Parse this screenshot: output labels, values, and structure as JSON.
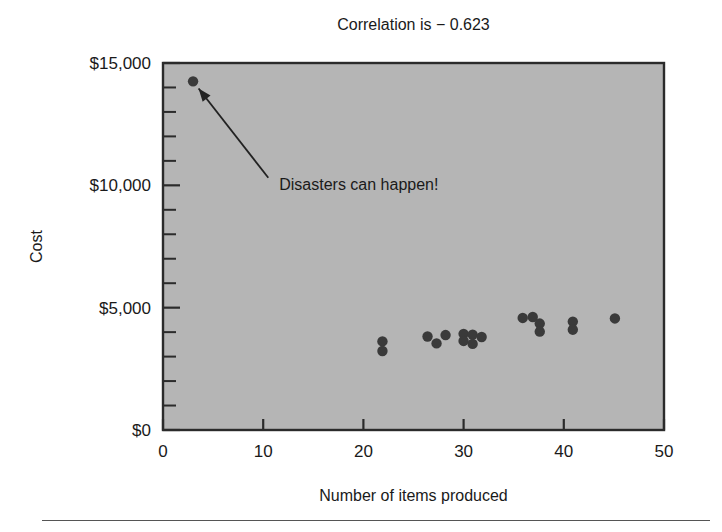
{
  "chart_data": {
    "type": "scatter",
    "title": "Correlation is − 0.623",
    "xlabel": "Number of items produced",
    "ylabel": "Cost",
    "xlim": [
      0,
      50
    ],
    "ylim": [
      0,
      15000
    ],
    "grid": false,
    "legend": null,
    "x_ticks": [
      0,
      10,
      20,
      30,
      40,
      50
    ],
    "x_tick_labels": [
      "0",
      "10",
      "20",
      "30",
      "40",
      "50"
    ],
    "y_ticks": [
      0,
      5000,
      10000,
      15000
    ],
    "y_tick_labels": [
      "$0",
      "$5,000",
      "$10,000",
      "$15,000"
    ],
    "y_minor_tick_step": 1000,
    "plot_background_color": "#b5b5b5",
    "point_color": "#3a3a3a",
    "points": [
      {
        "x": 3.0,
        "y": 14250
      },
      {
        "x": 21.9,
        "y": 3620
      },
      {
        "x": 21.9,
        "y": 3230
      },
      {
        "x": 26.4,
        "y": 3820
      },
      {
        "x": 27.3,
        "y": 3540
      },
      {
        "x": 28.2,
        "y": 3880
      },
      {
        "x": 30.0,
        "y": 3930
      },
      {
        "x": 30.0,
        "y": 3640
      },
      {
        "x": 30.9,
        "y": 3900
      },
      {
        "x": 30.9,
        "y": 3520
      },
      {
        "x": 31.8,
        "y": 3800
      },
      {
        "x": 35.9,
        "y": 4580
      },
      {
        "x": 36.9,
        "y": 4620
      },
      {
        "x": 37.6,
        "y": 4350
      },
      {
        "x": 37.6,
        "y": 4020
      },
      {
        "x": 40.9,
        "y": 4430
      },
      {
        "x": 40.9,
        "y": 4100
      },
      {
        "x": 45.1,
        "y": 4560
      }
    ],
    "annotations": [
      {
        "text": "Disasters can happen!",
        "target_x": 3.0,
        "target_y": 14250,
        "label_x": 11.0,
        "label_y": 10050
      }
    ]
  }
}
